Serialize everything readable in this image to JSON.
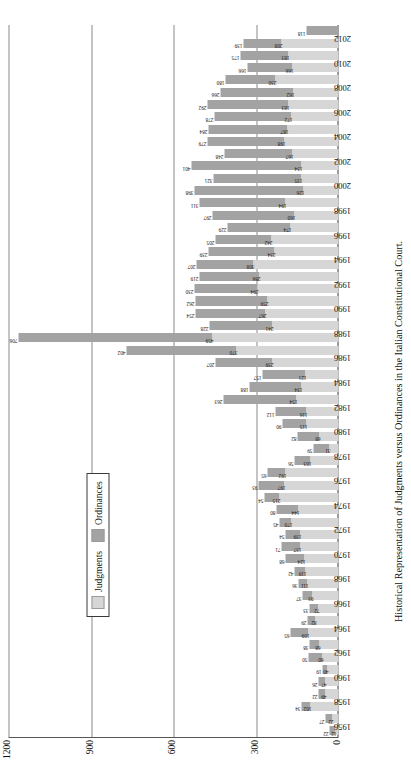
{
  "caption": "Historical Representation of Judgments versus Ordinances in the Italian Constitutional Court.",
  "legend": {
    "items": [
      {
        "label": "Judgments",
        "color": "#d6d6d6"
      },
      {
        "label": "Ordinances",
        "color": "#a3a3a3"
      }
    ]
  },
  "axis": {
    "value_ticks": [
      "1200",
      "900",
      "600",
      "300",
      "0"
    ],
    "value_max": 1200
  },
  "colors": {
    "judgments": "#d6d6d6",
    "ordinances": "#a3a3a3",
    "grid": "#8a8a8a",
    "axis": "#3a3a3a",
    "text": "#111111"
  },
  "chart_data": {
    "type": "bar",
    "title": "Historical Representation of Judgments versus Ordinances in the Italian Constitutional Court.",
    "subtitle": "",
    "orientation": "horizontal-stacked",
    "stacked": true,
    "xlabel": "",
    "ylabel": "",
    "ylim": [
      0,
      1200
    ],
    "grid": true,
    "legend_position": "inset-left",
    "categories": [
      "1956",
      "1957",
      "1958",
      "1959",
      "1960",
      "1961",
      "1962",
      "1963",
      "1964",
      "1965",
      "1966",
      "1967",
      "1968",
      "1969",
      "1970",
      "1971",
      "1972",
      "1973",
      "1974",
      "1975",
      "1976",
      "1977",
      "1978",
      "1979",
      "1980",
      "1981",
      "1982",
      "1983",
      "1984",
      "1985",
      "1986",
      "1987",
      "1988",
      "1989",
      "1990",
      "1991",
      "1992",
      "1993",
      "1994",
      "1995",
      "1996",
      "1997",
      "1998",
      "1999",
      "2000",
      "2001",
      "2002",
      "2003",
      "2004",
      "2005",
      "2006",
      "2007",
      "2008",
      "2009",
      "2010",
      "2011",
      "2012",
      "2013"
    ],
    "series": [
      {
        "name": "Judgments",
        "color": "#d6d6d6",
        "values": [
          12,
          22,
          102,
          49,
          47,
          40,
          60,
          68,
          109,
          82,
          72,
          93,
          111,
          119,
          124,
          137,
          139,
          170,
          144,
          215,
          197,
          192,
          103,
          31,
          68,
          115,
          116,
          154,
          134,
          121,
          239,
          370,
          459,
          241,
          267,
          259,
          294,
          286,
          308,
          234,
          242,
          174,
          160,
          194,
          126,
          135,
          134,
          167,
          198,
          187,
          172,
          183,
          162,
          230,
          166,
          183,
          208,
          0
        ]
      },
      {
        "name": "Ordinances",
        "color": "#a3a3a3",
        "values": [
          22,
          27,
          34,
          22,
          26,
          19,
          50,
          38,
          65,
          29,
          33,
          37,
          36,
          42,
          68,
          71,
          54,
          45,
          80,
          54,
          93,
          65,
          56,
          59,
          82,
          90,
          112,
          263,
          188,
          157,
          207,
          402,
          706,
          228,
          254,
          262,
          230,
          219,
          207,
          239,
          205,
          229,
          297,
          311,
          398,
          321,
          401,
          248,
          279,
          284,
          278,
          292,
          266,
          180,
          166,
          175,
          139,
          118
        ]
      }
    ],
    "bar_labels": {
      "ordinances": [
        "22",
        "27",
        "34",
        "22",
        "26",
        "19",
        "50",
        "38",
        "65",
        "29",
        "33",
        "37",
        "36",
        "42",
        "68",
        "71",
        "54",
        "45",
        "80",
        "54",
        "93",
        "65",
        "56",
        "59",
        "82",
        "90",
        "112",
        "263",
        "188",
        "157",
        "207",
        "402",
        "706",
        "228",
        "254",
        "262",
        "230",
        "219",
        "207",
        "239",
        "205",
        "229",
        "297",
        "311",
        "398",
        "321",
        "401",
        "248",
        "279",
        "284",
        "278",
        "292",
        "266",
        "180",
        "166",
        "175",
        "139",
        "118"
      ],
      "judgments": [
        "12",
        "22",
        "102",
        "49",
        "47",
        "40",
        "60",
        "68",
        "109",
        "82",
        "72",
        "93",
        "111",
        "119",
        "124",
        "137",
        "139",
        "170",
        "144",
        "215",
        "197",
        "192",
        "103",
        "31",
        "68",
        "115",
        "116",
        "154",
        "134",
        "121",
        "239",
        "370",
        "459",
        "241",
        "267",
        "259",
        "294",
        "286",
        "308",
        "234",
        "242",
        "174",
        "160",
        "194",
        "126",
        "135",
        "134",
        "167",
        "198",
        "187",
        "172",
        "183",
        "162",
        "230",
        "166",
        "183",
        "208",
        ""
      ]
    }
  }
}
